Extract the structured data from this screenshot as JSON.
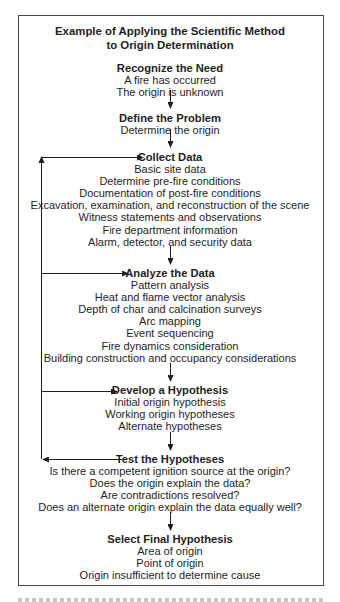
{
  "diagram": {
    "title_line1": "Example of Applying the Scientific Method",
    "title_line2": "to Origin Determination",
    "steps": [
      {
        "heading": "Recognize the Need",
        "items": [
          "A fire has occurred",
          "The origin is unknown"
        ]
      },
      {
        "heading": "Define the Problem",
        "items": [
          "Determine the origin"
        ]
      },
      {
        "heading": "Collect Data",
        "items": [
          "Basic site data",
          "Determine pre-fire conditions",
          "Documentation of post-fire conditions",
          "Excavation, examination, and reconstruction of the scene",
          "Witness statements and observations",
          "Fire department information",
          "Alarm, detector, and security data"
        ]
      },
      {
        "heading": "Analyze the Data",
        "items": [
          "Pattern analysis",
          "Heat and flame vector analysis",
          "Depth of char and calcination surveys",
          "Arc mapping",
          "Event sequencing",
          "Fire dynamics consideration",
          "Building construction and occupancy considerations"
        ]
      },
      {
        "heading": "Develop a Hypothesis",
        "items": [
          "Initial origin hypothesis",
          "Working origin hypotheses",
          "Alternate hypotheses"
        ]
      },
      {
        "heading": "Test the Hypotheses",
        "items": [
          "Is there a competent ignition source at the origin?",
          "Does the origin explain the data?",
          "Are contradictions resolved?",
          "Does an alternate origin explain the data equally well?"
        ]
      },
      {
        "heading": "Select Final Hypothesis",
        "items": [
          "Area of origin",
          "Point of origin",
          "Origin insufficient to determine cause"
        ]
      }
    ],
    "feedback_loop": {
      "from": "Test the Hypotheses",
      "to": [
        "Collect Data",
        "Analyze the Data",
        "Develop a Hypothesis"
      ]
    },
    "colors": {
      "ink": "#1e1e1e",
      "frame": "#4a4a4a",
      "background": "#ffffff"
    }
  }
}
